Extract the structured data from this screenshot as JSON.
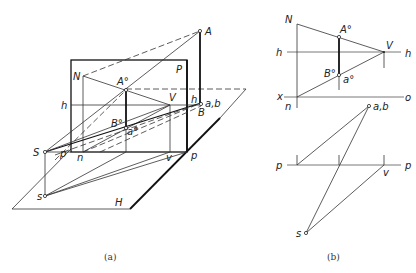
{
  "figure_a": {
    "caption": "(a)",
    "labels": {
      "A": "A",
      "N": "N",
      "P_plane": "P",
      "A_deg": "A°",
      "V": "V",
      "h_left": "h",
      "h_right": "h",
      "ab": "a,b",
      "B": "B",
      "B_deg": "B°",
      "a_deg": "a°",
      "S": "S",
      "p_left": "p",
      "n": "n",
      "v": "v",
      "p_right": "p",
      "s": "s",
      "H": "H"
    }
  },
  "figure_b": {
    "caption": "(b)",
    "labels": {
      "N": "N",
      "A_deg": "A°",
      "V": "V",
      "h_left": "h",
      "h_right": "h",
      "B_deg": "B°",
      "a_deg": "a°",
      "x": "x",
      "o": "o",
      "n": "n",
      "ab": "a,b",
      "p_left": "p",
      "p_right": "p",
      "v": "v",
      "s": "s"
    }
  }
}
